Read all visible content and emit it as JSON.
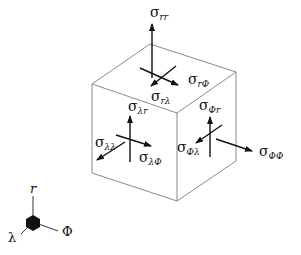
{
  "figure": {
    "type": "stress-tensor-cube",
    "labels": {
      "rr": {
        "main": "σ",
        "sub": "rr"
      },
      "rPhi": {
        "main": "σ",
        "sub": "rΦ"
      },
      "rLambda": {
        "main": "σ",
        "sub": "rλ"
      },
      "lambdaR": {
        "main": "σ",
        "sub": "λr"
      },
      "lambdaLambda": {
        "main": "σ",
        "sub": "λλ"
      },
      "lambdaPhi": {
        "main": "σ",
        "sub": "λΦ"
      },
      "phiR": {
        "main": "σ",
        "sub": "Φr"
      },
      "phiLambda": {
        "main": "σ",
        "sub": "Φλ"
      },
      "phiPhi": {
        "main": "σ",
        "sub": "ΦΦ"
      }
    },
    "axes": {
      "r": "r",
      "lambda": "λ",
      "phi": "Φ"
    }
  }
}
